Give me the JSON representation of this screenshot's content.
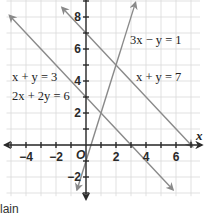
{
  "chart_data": {
    "type": "line",
    "title": "",
    "xlabel": "x",
    "ylabel": "",
    "xlim": [
      -5.3,
      7.6
    ],
    "ylim": [
      -3.2,
      9.1
    ],
    "grid": true,
    "x_ticks": [
      -4,
      -2,
      2,
      4,
      6
    ],
    "y_ticks": [
      -2,
      2,
      4,
      6,
      8
    ],
    "x_tick_labels": [
      "−4",
      "−2",
      "2",
      "4",
      "6"
    ],
    "y_tick_labels": [
      "−2",
      "2",
      "4",
      "6",
      "8"
    ],
    "origin_label": "O",
    "series": [
      {
        "name": "x + y = 7",
        "equation": "x + y = 7",
        "slope": -1,
        "intercept": 7,
        "x_range": [
          -1.6,
          7.1
        ]
      },
      {
        "name": "x + y = 3 / 2x + 2y = 6",
        "equation": "x + y = 3",
        "slope": -1,
        "intercept": 3,
        "x_range": [
          -5.1,
          5.8
        ]
      },
      {
        "name": "3x − y = 1",
        "equation": "3x − y = 1",
        "slope": 3,
        "intercept": -1,
        "x_range": [
          -0.6,
          3.3
        ]
      }
    ],
    "annotations": [
      {
        "id": "eq1",
        "text": "3x − y = 1"
      },
      {
        "id": "eq2",
        "text": "x + y = 7"
      },
      {
        "id": "eq3",
        "text": "x + y = 3"
      },
      {
        "id": "eq4",
        "text": "2x + 2y = 6"
      }
    ]
  },
  "footer": {
    "text": "lain"
  },
  "colors": {
    "line": "#8a8a8a",
    "axis": "#2a2a2a",
    "grid": "#d9d9d9"
  }
}
